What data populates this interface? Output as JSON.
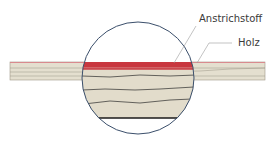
{
  "diagram": {
    "labels": {
      "coating": "Anstrichstoff",
      "wood": "Holz"
    },
    "colors": {
      "wood_fill": "#e2dccb",
      "wood_lines": "#8a8577",
      "coating": "#c8373f",
      "coating_edge": "#d98a8e",
      "circle_stroke": "#3b4f6b",
      "grain_lines": "#2b2b2b",
      "leader_lines": "#9a9a9a"
    }
  }
}
